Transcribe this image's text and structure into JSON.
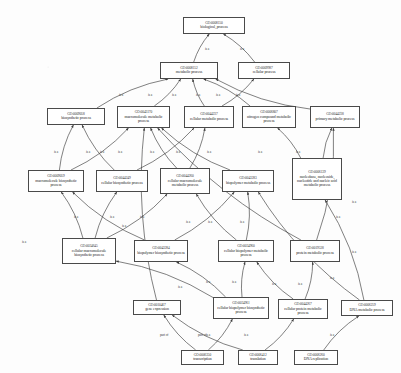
{
  "diagram": {
    "type": "directed-acyclic-graph",
    "relation_labels": {
      "is_a": "is a",
      "part_of": "part of"
    },
    "nodes": [
      {
        "id": "n0",
        "go_id": "GO:0008150",
        "label": "biological_process",
        "x": 183,
        "y": 17,
        "w": 62,
        "h": 17
      },
      {
        "id": "n1",
        "go_id": "GO:0008152",
        "label": "metabolic process",
        "x": 160,
        "y": 62,
        "w": 58,
        "h": 17
      },
      {
        "id": "n2",
        "go_id": "GO:0009987",
        "label": "cellular process",
        "x": 238,
        "y": 62,
        "w": 52,
        "h": 17
      },
      {
        "id": "n3",
        "go_id": "GO:0009058",
        "label": "biosynthetic process",
        "x": 47,
        "y": 108,
        "w": 58,
        "h": 17
      },
      {
        "id": "n4",
        "go_id": "GO:0043170",
        "label": "macromolecule metabolic process",
        "x": 117,
        "y": 106,
        "w": 53,
        "h": 22
      },
      {
        "id": "n5",
        "go_id": "GO:0044237",
        "label": "cellular metabolic process",
        "x": 184,
        "y": 106,
        "w": 50,
        "h": 22
      },
      {
        "id": "n6",
        "go_id": "GO:0006807",
        "label": "nitrogen compound metabolic process",
        "x": 242,
        "y": 106,
        "w": 54,
        "h": 22
      },
      {
        "id": "n7",
        "go_id": "GO:0044238",
        "label": "primary metabolic process",
        "x": 310,
        "y": 106,
        "w": 50,
        "h": 22
      },
      {
        "id": "n8",
        "go_id": "GO:0009059",
        "label": "macromolecule biosynthetic process",
        "x": 28,
        "y": 170,
        "w": 56,
        "h": 22
      },
      {
        "id": "n9",
        "go_id": "GO:0044249",
        "label": "cellular biosynthetic process",
        "x": 96,
        "y": 170,
        "w": 52,
        "h": 22
      },
      {
        "id": "n10",
        "go_id": "GO:0044260",
        "label": "cellular macromolecule metabolic process",
        "x": 160,
        "y": 168,
        "w": 50,
        "h": 26
      },
      {
        "id": "n11",
        "go_id": "GO:0043283",
        "label": "biopolymer metabolic process",
        "x": 222,
        "y": 170,
        "w": 52,
        "h": 22
      },
      {
        "id": "n12",
        "go_id": "GO:0006139",
        "label": "nucleobase, nucleoside, nucleotide and nucleic acid metabolic process",
        "x": 292,
        "y": 158,
        "w": 50,
        "h": 42
      },
      {
        "id": "n13",
        "go_id": "GO:0034645",
        "label": "cellular macromolecule biosynthetic process",
        "x": 62,
        "y": 238,
        "w": 54,
        "h": 26
      },
      {
        "id": "n14",
        "go_id": "GO:0043284",
        "label": "biopolymer biosynthetic process",
        "x": 134,
        "y": 240,
        "w": 54,
        "h": 22
      },
      {
        "id": "n15",
        "go_id": "GO:0034960",
        "label": "cellular biopolymer metabolic process",
        "x": 218,
        "y": 240,
        "w": 56,
        "h": 22
      },
      {
        "id": "n16",
        "go_id": "GO:0019538",
        "label": "protein metabolic process",
        "x": 290,
        "y": 240,
        "w": 50,
        "h": 22
      },
      {
        "id": "n17",
        "go_id": "GO:0010467",
        "label": "gene expression",
        "x": 133,
        "y": 300,
        "w": 48,
        "h": 15
      },
      {
        "id": "n18",
        "go_id": "GO:0034961",
        "label": "cellular biopolymer biosynthetic process",
        "x": 213,
        "y": 297,
        "w": 56,
        "h": 22
      },
      {
        "id": "n19",
        "go_id": "GO:0044267",
        "label": "cellular protein metabolic process",
        "x": 278,
        "y": 299,
        "w": 50,
        "h": 20
      },
      {
        "id": "n20",
        "go_id": "GO:0006259",
        "label": "DNA metabolic process",
        "x": 341,
        "y": 300,
        "w": 52,
        "h": 16
      },
      {
        "id": "n21",
        "go_id": "GO:0006350",
        "label": "transcription",
        "x": 181,
        "y": 350,
        "w": 43,
        "h": 15
      },
      {
        "id": "n22",
        "go_id": "GO:0006412",
        "label": "translation",
        "x": 238,
        "y": 350,
        "w": 40,
        "h": 15
      },
      {
        "id": "n23",
        "go_id": "GO:0006260",
        "label": "DNA replication",
        "x": 294,
        "y": 350,
        "w": 44,
        "h": 15
      }
    ],
    "edges": [
      {
        "from": "n1",
        "to": "n0",
        "relation": "is a",
        "lx": 205,
        "ly": 47
      },
      {
        "from": "n2",
        "to": "n0",
        "relation": "is a",
        "lx": 240,
        "ly": 47
      },
      {
        "from": "n3",
        "to": "n1",
        "relation": "is a",
        "lx": 119,
        "ly": 93
      },
      {
        "from": "n4",
        "to": "n1",
        "relation": "is a",
        "lx": 148,
        "ly": 93
      },
      {
        "from": "n5",
        "to": "n1",
        "relation": "is a",
        "lx": 172,
        "ly": 93
      },
      {
        "from": "n6",
        "to": "n1",
        "relation": "is a",
        "lx": 196,
        "ly": 93
      },
      {
        "from": "n7",
        "to": "n1",
        "relation": "is a",
        "lx": 216,
        "ly": 93
      },
      {
        "from": "n5",
        "to": "n2",
        "relation": "is a",
        "lx": 236,
        "ly": 93
      },
      {
        "from": "n8",
        "to": "n3",
        "relation": "is a",
        "lx": 54,
        "ly": 150
      },
      {
        "from": "n8",
        "to": "n4",
        "relation": "is a",
        "lx": 86,
        "ly": 150
      },
      {
        "from": "n9",
        "to": "n3",
        "relation": "is a",
        "lx": 100,
        "ly": 150
      },
      {
        "from": "n9",
        "to": "n5",
        "relation": "is a",
        "lx": 118,
        "ly": 150
      },
      {
        "from": "n10",
        "to": "n4",
        "relation": "is a",
        "lx": 150,
        "ly": 150
      },
      {
        "from": "n10",
        "to": "n5",
        "relation": "is a",
        "lx": 176,
        "ly": 150
      },
      {
        "from": "n11",
        "to": "n4",
        "relation": "is a",
        "lx": 207,
        "ly": 150
      },
      {
        "from": "n12",
        "to": "n6",
        "relation": "is a",
        "lx": 258,
        "ly": 150
      },
      {
        "from": "n12",
        "to": "n7",
        "relation": "is a",
        "lx": 296,
        "ly": 150
      },
      {
        "from": "n13",
        "to": "n8",
        "relation": "is a",
        "lx": 74,
        "ly": 215
      },
      {
        "from": "n13",
        "to": "n9",
        "relation": "is a",
        "lx": 110,
        "ly": 215
      },
      {
        "from": "n13",
        "to": "n10",
        "relation": "is a",
        "lx": 140,
        "ly": 215
      },
      {
        "from": "n14",
        "to": "n8",
        "relation": "is a",
        "lx": 122,
        "ly": 224
      },
      {
        "from": "n14",
        "to": "n11",
        "relation": "is a",
        "lx": 186,
        "ly": 220
      },
      {
        "from": "n15",
        "to": "n10",
        "relation": "is a",
        "lx": 208,
        "ly": 220
      },
      {
        "from": "n15",
        "to": "n11",
        "relation": "is a",
        "lx": 240,
        "ly": 220
      },
      {
        "from": "n16",
        "to": "n4",
        "relation": "is a",
        "lx": 336,
        "ly": 215
      },
      {
        "from": "n16",
        "to": "n7",
        "relation": "is a",
        "lx": 352,
        "ly": 200
      },
      {
        "from": "n17",
        "to": "n4",
        "relation": "is a",
        "lx": 22,
        "ly": 240
      },
      {
        "from": "n18",
        "to": "n14",
        "relation": "is a",
        "lx": 206,
        "ly": 280
      },
      {
        "from": "n18",
        "to": "n15",
        "relation": "is a",
        "lx": 232,
        "ly": 280
      },
      {
        "from": "n18",
        "to": "n13",
        "relation": "is a",
        "lx": 178,
        "ly": 285
      },
      {
        "from": "n19",
        "to": "n15",
        "relation": "is a",
        "lx": 272,
        "ly": 282
      },
      {
        "from": "n19",
        "to": "n16",
        "relation": "is a",
        "lx": 298,
        "ly": 282
      },
      {
        "from": "n20",
        "to": "n11",
        "relation": "is a",
        "lx": 330,
        "ly": 276
      },
      {
        "from": "n20",
        "to": "n12",
        "relation": "is a",
        "lx": 352,
        "ly": 250
      },
      {
        "from": "n21",
        "to": "n17",
        "relation": "part of",
        "lx": 160,
        "ly": 333
      },
      {
        "from": "n21",
        "to": "n18",
        "relation": "is a",
        "lx": 206,
        "ly": 333
      },
      {
        "from": "n22",
        "to": "n17",
        "relation": "part of",
        "lx": 198,
        "ly": 333
      },
      {
        "from": "n22",
        "to": "n19",
        "relation": "is a",
        "lx": 244,
        "ly": 333
      },
      {
        "from": "n23",
        "to": "n20",
        "relation": "is a",
        "lx": 330,
        "ly": 333
      }
    ]
  }
}
